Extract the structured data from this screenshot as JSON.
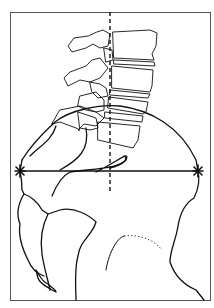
{
  "figure": {
    "colors": {
      "background": "#ffffff",
      "ink": "#111111",
      "frame": "#555555"
    },
    "markers": [
      {
        "name": "left-star-marker",
        "x": 20,
        "y": 171
      },
      {
        "name": "right-star-marker",
        "x": 198,
        "y": 171
      }
    ],
    "lines": {
      "horizontal": {
        "x1": 20,
        "y1": 171,
        "x2": 198,
        "y2": 171
      },
      "vertical_dashed": {
        "x1": 110,
        "y1": 12,
        "x2": 110,
        "y2": 192
      }
    }
  }
}
